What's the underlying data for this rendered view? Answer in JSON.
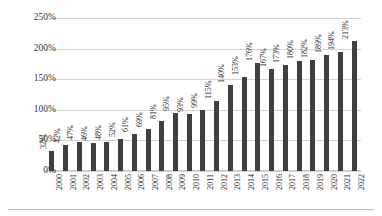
{
  "chart_data": {
    "type": "bar",
    "title": "",
    "subtitle": "",
    "xlabel": "",
    "ylabel": "",
    "categories": [
      "2000",
      "2001",
      "2002",
      "2003",
      "2004",
      "2005",
      "2006",
      "2007",
      "2008",
      "2009",
      "2010",
      "2011",
      "2012",
      "2013",
      "2014",
      "2015",
      "2016",
      "2017",
      "2018",
      "2019",
      "2020",
      "2021",
      "2022"
    ],
    "values": [
      32,
      42,
      47,
      46,
      48,
      52,
      61,
      69,
      81,
      95,
      93,
      99,
      115,
      140,
      153,
      176,
      167,
      173,
      180,
      182,
      189,
      194,
      213
    ],
    "data_labels": [
      "32%",
      "42%",
      "47%",
      "46%",
      "48%",
      "52%",
      "61%",
      "69%",
      "81%",
      "95%",
      "93%",
      "99%",
      "115%",
      "140%",
      "153%",
      "176%",
      "167%",
      "173%",
      "180%",
      "182%",
      "189%",
      "194%",
      "213%"
    ],
    "ylim": [
      0,
      250
    ],
    "ytick_values": [
      0,
      50,
      100,
      150,
      200,
      250
    ],
    "ytick_labels": [
      "0%",
      "50%",
      "100%",
      "150%",
      "200%",
      "250%"
    ],
    "grid": true,
    "legend": false,
    "legend_position": "none",
    "bar_color": "#404040",
    "gridline_color": "#d4d4d4",
    "background_color": "#ffffff"
  }
}
